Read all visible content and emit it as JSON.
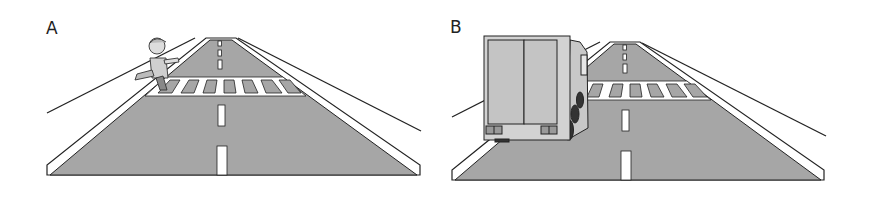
{
  "figure": {
    "panels": [
      {
        "label": "A",
        "scene": "road with pedestrian crossing, child running across crosswalk"
      },
      {
        "label": "B",
        "scene": "road with pedestrian crossing, truck stopped obstructing view of crosswalk"
      }
    ],
    "colors": {
      "road": "#a6a6a6",
      "stroke": "#222222",
      "marking": "#ffffff",
      "truck_body": "#d2d2d2",
      "background": "#ffffff"
    }
  }
}
